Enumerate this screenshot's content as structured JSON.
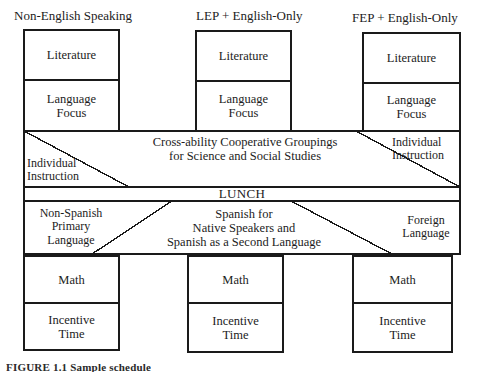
{
  "figure": {
    "caption": "FIGURE 1.1  Sample schedule",
    "columns": [
      {
        "id": "non-english-speaking",
        "header": "Non-English Speaking"
      },
      {
        "id": "lep-english-only",
        "header": "LEP + English-Only"
      },
      {
        "id": "fep-english-only",
        "header": "FEP + English-Only"
      }
    ],
    "cells": {
      "literature": "Literature",
      "language_focus": "Language\nFocus",
      "cooperative": "Cross-ability Cooperative Groupings\nfor Science and Social Studies",
      "individual_instruction": "Individual\nInstruction",
      "lunch": "LUNCH",
      "non_spanish_primary": "Non-Spanish\nPrimary\nLanguage",
      "spanish": "Spanish for\nNative Speakers and\nSpanish as a Second Language",
      "foreign_language": "Foreign\nLanguage",
      "math": "Math",
      "incentive_time": "Incentive\nTime"
    },
    "style": {
      "stroke": "#1a1a1a",
      "fill": "#ffffff",
      "background": "#ffffff"
    }
  }
}
